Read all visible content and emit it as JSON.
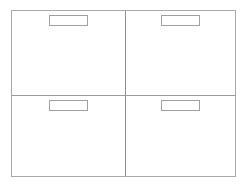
{
  "panels": [
    {
      "position": "top-left",
      "label": ""
    },
    {
      "position": "top-right",
      "label": ""
    },
    {
      "position": "bottom-left",
      "label": ""
    },
    {
      "position": "bottom-right",
      "label": ""
    }
  ]
}
